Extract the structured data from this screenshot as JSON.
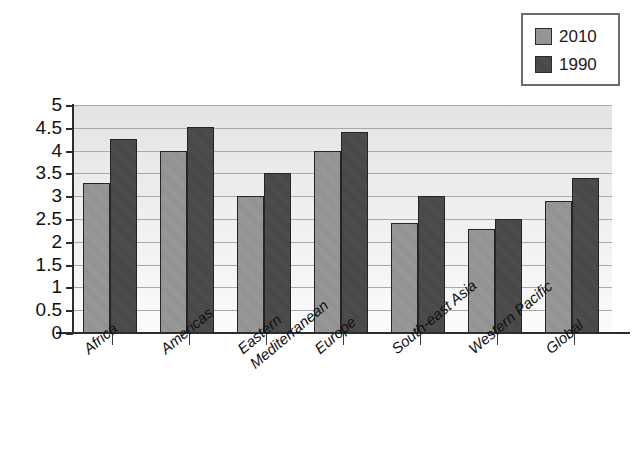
{
  "chart_data": {
    "type": "bar",
    "title": "",
    "subtitle": "",
    "xlabel": "",
    "ylabel": "",
    "ylim": [
      0,
      5
    ],
    "ytick_step": 0.5,
    "yticks": [
      "5",
      "4.5",
      "4",
      "3.5",
      "3",
      "2.5",
      "2",
      "1.5",
      "1",
      "0.5",
      "0"
    ],
    "grid": true,
    "legend_position": "top-right",
    "categories": [
      "Africa",
      "Americas",
      "Eastern Mediterranean",
      "Europe",
      "South-east Asia",
      "Western Pacific",
      "Global"
    ],
    "category_lines": [
      [
        "Africa"
      ],
      [
        "Americas"
      ],
      [
        "Eastern",
        "Mediterranean"
      ],
      [
        "Europe"
      ],
      [
        "South-east Asia"
      ],
      [
        "Western Pacific"
      ],
      [
        "Global"
      ]
    ],
    "series": [
      {
        "name": "2010",
        "color": "#919191",
        "values": [
          3.3,
          4.0,
          3.0,
          4.0,
          2.42,
          2.28,
          2.9
        ]
      },
      {
        "name": "1990",
        "color": "#4a4a4a",
        "values": [
          4.25,
          4.52,
          3.5,
          4.4,
          3.0,
          2.5,
          3.4
        ]
      }
    ]
  },
  "legend": {
    "items": [
      {
        "label": "2010",
        "color": "#919191"
      },
      {
        "label": "1990",
        "color": "#4a4a4a"
      }
    ]
  },
  "colors": {
    "series_2010": "#919191",
    "series_1990": "#4a4a4a",
    "axis": "#2d2d2d",
    "gridline": "#a9a9a9",
    "plot_background": "#ededed",
    "page_background": "#ffffff",
    "text": "#111111"
  }
}
